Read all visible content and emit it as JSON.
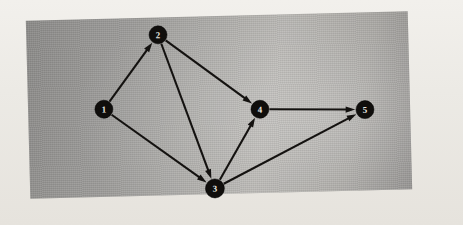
{
  "figure": {
    "kind": "directed-graph-diagram",
    "medium": "scanned photograph on paper",
    "panel_color": "#a3a19d",
    "ink_color": "#141210",
    "node_label_color": "#e8e6e1"
  },
  "chart_data": {
    "type": "diagram",
    "graph_type": "directed",
    "title": "",
    "xlabel": "",
    "ylabel": "",
    "node_count": 5,
    "edge_count": 7,
    "nodes": [
      {
        "id": "1",
        "label": "1",
        "x": 104,
        "y": 106,
        "r": 9
      },
      {
        "id": "2",
        "label": "2",
        "x": 160,
        "y": 33,
        "r": 9
      },
      {
        "id": "3",
        "label": "3",
        "x": 213,
        "y": 188,
        "r": 9.5
      },
      {
        "id": "4",
        "label": "4",
        "x": 260,
        "y": 110,
        "r": 9
      },
      {
        "id": "5",
        "label": "5",
        "x": 365,
        "y": 113,
        "r": 9
      }
    ],
    "edges": [
      {
        "from": "1",
        "to": "2",
        "directed": true,
        "label": ""
      },
      {
        "from": "1",
        "to": "3",
        "directed": true,
        "label": ""
      },
      {
        "from": "2",
        "to": "4",
        "directed": true,
        "label": ""
      },
      {
        "from": "2",
        "to": "3",
        "directed": true,
        "label": ""
      },
      {
        "from": "3",
        "to": "4",
        "directed": true,
        "label": ""
      },
      {
        "from": "3",
        "to": "5",
        "directed": true,
        "label": ""
      },
      {
        "from": "4",
        "to": "5",
        "directed": true,
        "label": ""
      }
    ],
    "adjacency_list": {
      "1": [
        "2",
        "3"
      ],
      "2": [
        "3",
        "4"
      ],
      "3": [
        "4",
        "5"
      ],
      "4": [
        "5"
      ],
      "5": []
    }
  },
  "background": {
    "ghost_text_top": "",
    "ghost_text_middle": "",
    "ghost_text_bottom": "",
    "ghost_text_right": ""
  }
}
